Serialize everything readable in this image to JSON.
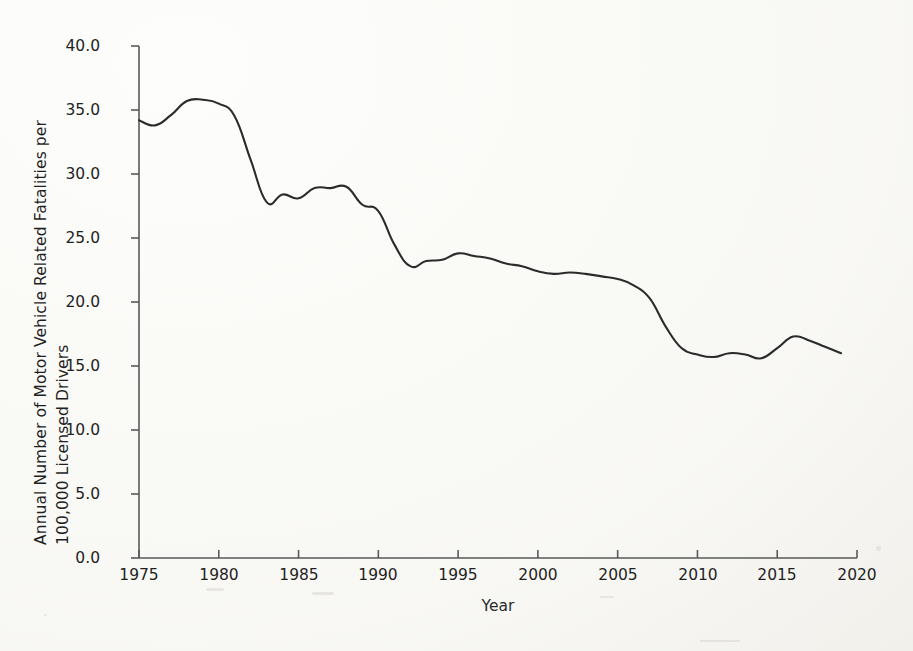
{
  "figure": {
    "background_color": "#fdfdfb",
    "line_color": "#2b2b2b",
    "axis_color": "#595959"
  },
  "chart_data": {
    "type": "line",
    "title": "",
    "xlabel": "Year",
    "ylabel": "Annual Number of Motor Vehicle Related Fatalities per 100,000 Licensed Drivers",
    "ylabel_line1": "Annual Number of Motor Vehicle Related Fatalities per",
    "ylabel_line2": "100,000 Licensed Drivers",
    "xlim": [
      1975,
      2020
    ],
    "ylim": [
      0.0,
      40.0
    ],
    "grid": false,
    "legend": false,
    "x_tick_labels": [
      "1975",
      "1980",
      "1985",
      "1990",
      "1995",
      "2000",
      "2005",
      "2010",
      "2015",
      "2020"
    ],
    "x_ticks": [
      1975,
      1980,
      1985,
      1990,
      1995,
      2000,
      2005,
      2010,
      2015,
      2020
    ],
    "y_tick_labels": [
      "0.0",
      "5.0",
      "10.0",
      "15.0",
      "20.0",
      "25.0",
      "30.0",
      "35.0",
      "40.0"
    ],
    "y_ticks": [
      0.0,
      5.0,
      10.0,
      15.0,
      20.0,
      25.0,
      30.0,
      35.0,
      40.0
    ],
    "x": [
      1975,
      1976,
      1977,
      1978,
      1979,
      1980,
      1981,
      1982,
      1983,
      1984,
      1985,
      1986,
      1987,
      1988,
      1989,
      1990,
      1991,
      1992,
      1993,
      1994,
      1995,
      1996,
      1997,
      1998,
      1999,
      2000,
      2001,
      2002,
      2003,
      2004,
      2005,
      2006,
      2007,
      2008,
      2009,
      2010,
      2011,
      2012,
      2013,
      2014,
      2015,
      2016,
      2017,
      2018,
      2019
    ],
    "values": [
      34.2,
      33.8,
      34.6,
      35.7,
      35.8,
      35.5,
      34.5,
      31.1,
      27.8,
      28.4,
      28.1,
      28.9,
      28.9,
      29.0,
      27.6,
      27.1,
      24.5,
      22.8,
      23.2,
      23.3,
      23.8,
      23.6,
      23.4,
      23.0,
      22.8,
      22.4,
      22.2,
      22.3,
      22.2,
      22.0,
      21.8,
      21.3,
      20.3,
      18.1,
      16.4,
      15.9,
      15.7,
      16.0,
      15.9,
      15.6,
      16.4,
      17.3,
      17.0,
      16.5,
      16.0
    ],
    "series": [
      {
        "name": "Fatality rate per 100,000 licensed drivers",
        "values": [
          34.2,
          33.8,
          34.6,
          35.7,
          35.8,
          35.5,
          34.5,
          31.1,
          27.8,
          28.4,
          28.1,
          28.9,
          28.9,
          29.0,
          27.6,
          27.1,
          24.5,
          22.8,
          23.2,
          23.3,
          23.8,
          23.6,
          23.4,
          23.0,
          22.8,
          22.4,
          22.2,
          22.3,
          22.2,
          22.0,
          21.8,
          21.3,
          20.3,
          18.1,
          16.4,
          15.9,
          15.7,
          16.0,
          15.9,
          15.6,
          16.4,
          17.3,
          17.0,
          16.5,
          16.0
        ]
      }
    ]
  }
}
